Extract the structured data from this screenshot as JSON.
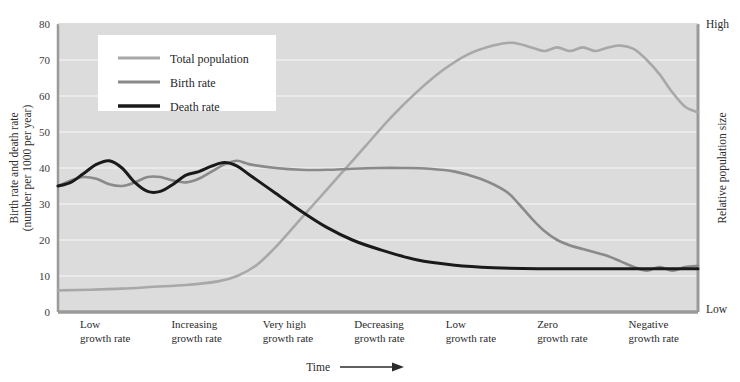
{
  "figure": {
    "background": "#ffffff",
    "plot_background": "#dcdcdc",
    "gridline_color": "#efefef",
    "axis_color": "#9a9a9a"
  },
  "legend": {
    "items": [
      {
        "label": "Total population",
        "color": "#a8a8a8",
        "key": "total_population"
      },
      {
        "label": "Birth rate",
        "color": "#8a8a8a",
        "key": "birth_rate"
      },
      {
        "label": "Death rate",
        "color": "#1a1a1a",
        "key": "death_rate"
      }
    ]
  },
  "axes": {
    "left_title_line1": "Birth rate and death rate",
    "left_title_line2": "(number per 1000 per year)",
    "right_title": "Relative population size",
    "right_top_label": "High",
    "right_bottom_label": "Low",
    "x_title": "Time",
    "y_ticks": [
      0,
      10,
      20,
      30,
      40,
      50,
      60,
      70,
      80
    ]
  },
  "stages": [
    {
      "line1": "Low",
      "line2": "growth rate"
    },
    {
      "line1": "Increasing",
      "line2": "growth rate"
    },
    {
      "line1": "Very high",
      "line2": "growth rate"
    },
    {
      "line1": "Decreasing",
      "line2": "growth rate"
    },
    {
      "line1": "Low",
      "line2": "growth rate"
    },
    {
      "line1": "Zero",
      "line2": "growth rate"
    },
    {
      "line1": "Negative",
      "line2": "growth rate"
    }
  ],
  "chart_data": {
    "type": "line",
    "title": "",
    "xlabel": "Time",
    "ylabel": "Birth rate and death rate (number per 1000 per year)",
    "y2label": "Relative population size",
    "ylim": [
      0,
      80
    ],
    "xlim": [
      0,
      100
    ],
    "grid": true,
    "legend_position": "top-left",
    "x_tick_labels": [
      "Low growth rate",
      "Increasing growth rate",
      "Very high growth rate",
      "Decreasing growth rate",
      "Low growth rate",
      "Zero growth rate",
      "Negative growth rate"
    ],
    "y2_tick_labels": [
      "Low",
      "High"
    ],
    "series": [
      {
        "name": "Birth rate",
        "color": "#8a8a8a",
        "x": [
          0,
          2,
          4,
          6,
          8,
          10,
          12,
          14,
          16,
          18,
          20,
          22,
          24,
          26,
          28,
          30,
          34,
          38,
          42,
          46,
          50,
          54,
          58,
          62,
          66,
          70,
          72,
          74,
          76,
          78,
          80,
          82,
          84,
          86,
          88,
          90,
          92,
          94,
          96,
          98,
          100
        ],
        "y": [
          35,
          36.5,
          37.5,
          37,
          35.5,
          35,
          36,
          37.5,
          37.5,
          36.5,
          36,
          37,
          39,
          41,
          42,
          41,
          40,
          39.5,
          39.5,
          39.8,
          40,
          40,
          39.8,
          39,
          37,
          33.5,
          30,
          26,
          22.5,
          20,
          18.5,
          17.5,
          16.5,
          15.5,
          14,
          12.5,
          11.5,
          12.5,
          11.5,
          12.5,
          12.8
        ]
      },
      {
        "name": "Death rate",
        "color": "#1a1a1a",
        "x": [
          0,
          2,
          4,
          6,
          8,
          10,
          12,
          14,
          16,
          18,
          20,
          22,
          24,
          26,
          28,
          30,
          34,
          38,
          42,
          46,
          50,
          56,
          62,
          68,
          75,
          85,
          100
        ],
        "y": [
          35,
          36,
          38.5,
          41,
          42,
          40,
          36,
          33.5,
          33.5,
          35.5,
          38,
          39,
          40.5,
          41.5,
          40.5,
          38,
          33,
          28,
          23.5,
          20,
          17.5,
          14.5,
          13,
          12.3,
          12,
          12,
          12
        ]
      },
      {
        "name": "Total population",
        "color": "#a8a8a8",
        "x": [
          0,
          5,
          10,
          15,
          20,
          25,
          28,
          31,
          34,
          37,
          40,
          44,
          48,
          52,
          56,
          60,
          64,
          68,
          71,
          74,
          76,
          78,
          80,
          82,
          84,
          86,
          88,
          90,
          92,
          94,
          96,
          98,
          100
        ],
        "y": [
          6,
          6.2,
          6.5,
          7,
          7.5,
          8.5,
          10,
          13,
          18,
          24,
          30,
          38,
          46,
          54,
          61,
          67,
          71.5,
          74,
          74.8,
          73.5,
          72.5,
          73.5,
          72.5,
          73.5,
          72.5,
          73.5,
          74,
          73,
          70,
          66,
          61,
          57,
          55.5
        ]
      }
    ],
    "notes": [
      "Birth rate and death rate oscillate together at a high level during the low-growth stage.",
      "Death rate falls steeply and plateaus near 12 per 1000.",
      "Total population rises steeply, peaks near 75, then declines to about 55.",
      "Birth rate falls below the death rate in the negative growth stage."
    ]
  }
}
